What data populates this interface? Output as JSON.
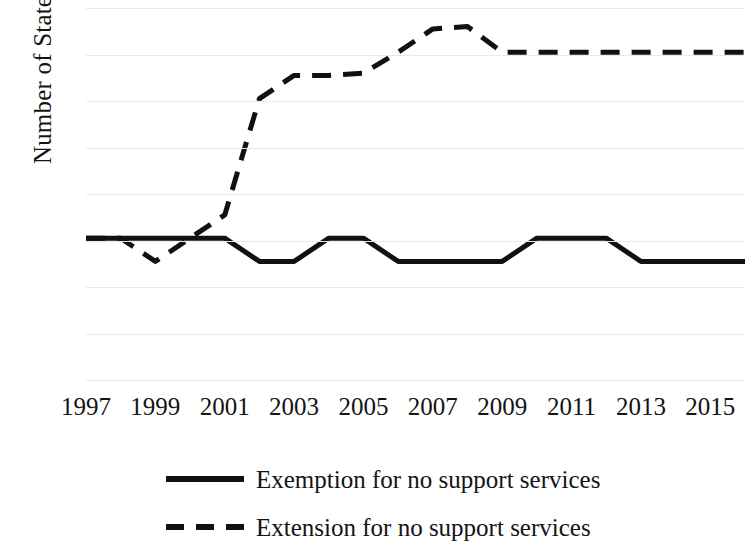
{
  "chart_data": {
    "type": "line",
    "title": "",
    "subtitle": "",
    "xlabel": "",
    "ylabel": "Number of States",
    "xlim": [
      1997,
      2016
    ],
    "ylim": [
      0,
      16
    ],
    "ytick_step": 2,
    "yticks": [
      16,
      14,
      12,
      10,
      8,
      6,
      4,
      2,
      0
    ],
    "xticks": [
      1997,
      1999,
      2001,
      2003,
      2005,
      2007,
      2009,
      2011,
      2013,
      2015
    ],
    "x": [
      1997,
      1998,
      1999,
      2000,
      2001,
      2002,
      2003,
      2004,
      2005,
      2006,
      2007,
      2008,
      2009,
      2010,
      2011,
      2012,
      2013,
      2014,
      2015,
      2016
    ],
    "grid": "horizontal",
    "legend_position": "bottom",
    "series": [
      {
        "name": "Exemption for no support services",
        "style": "solid",
        "color": "#111111",
        "values": [
          6.1,
          6.1,
          6.1,
          6.1,
          6.1,
          5.1,
          5.1,
          6.1,
          6.1,
          5.1,
          5.1,
          5.1,
          5.1,
          6.1,
          6.1,
          6.1,
          5.1,
          5.1,
          5.1,
          5.1
        ]
      },
      {
        "name": "Extension for no support services",
        "style": "dashed",
        "color": "#111111",
        "values": [
          6.1,
          6.1,
          5.1,
          6.1,
          7.1,
          12.1,
          13.1,
          13.1,
          13.2,
          14.1,
          15.1,
          15.2,
          14.1,
          14.1,
          14.1,
          14.1,
          14.1,
          14.1,
          14.1,
          14.1
        ]
      }
    ]
  },
  "axis": {
    "ylabel": "Number of States",
    "ytick_labels": [
      "16",
      "14",
      "12",
      "10",
      "8",
      "6",
      "4",
      "2",
      "0"
    ],
    "xtick_labels": [
      "1997",
      "1999",
      "2001",
      "2003",
      "2005",
      "2007",
      "2009",
      "2011",
      "2013",
      "2015"
    ]
  },
  "legend": {
    "items": [
      {
        "label": "Exemption for no support services",
        "style": "solid"
      },
      {
        "label": "Extension for no support services",
        "style": "dashed"
      }
    ]
  }
}
